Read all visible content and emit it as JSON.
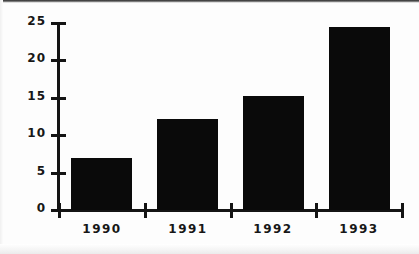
{
  "chart_data": {
    "type": "bar",
    "title": "",
    "subtitle": "",
    "xlabel": "",
    "ylabel": "",
    "categories": [
      "1990",
      "1991",
      "1992",
      "1993"
    ],
    "values": [
      7.0,
      12.2,
      15.2,
      24.5
    ],
    "ylim": [
      0,
      25
    ],
    "yticks": [
      0,
      5,
      10,
      15,
      20,
      25
    ],
    "ytick_labels": [
      "0",
      "5",
      "10",
      "15",
      "20",
      "25"
    ],
    "grid": false,
    "legend": null,
    "legend_position": "none",
    "bar_color": "#0a0a0a",
    "axis_color": "#141414",
    "background_color": "#fdfdfd",
    "annotations": []
  },
  "axes": {
    "y_axis_name": "y-axis",
    "x_axis_name": "x-axis"
  }
}
